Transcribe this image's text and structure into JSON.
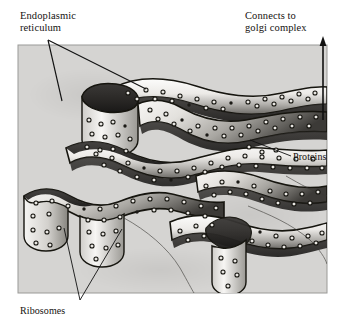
{
  "figure": {
    "kind": "biology-diagram",
    "subject": "endoplasmic reticulum",
    "panel": {
      "background_color": "#d5d4d2",
      "border_color": "#8d8d8b",
      "x": 18,
      "y": 45,
      "width": 309,
      "height": 248
    },
    "palette": {
      "page_background": "#ffffff",
      "panel_fill": "#d5d4d2",
      "membrane_light": "#fbfbfa",
      "membrane_mid": "#b9b8b5",
      "membrane_shadow": "#4a4845",
      "membrane_dark": "#201f1d",
      "outline": "#16150f",
      "ribosome_ring": "#15140f",
      "leader_line": "#111111",
      "text": "#15120f"
    }
  },
  "labels": {
    "endoplasmic_reticulum": "Endoplasmic\nreticulum",
    "connects_to_golgi": "Connects to\ngolgi complex",
    "proteins": "Proteins",
    "ribosomes": "Ribosomes"
  },
  "annotations": {
    "leaders": [
      {
        "name": "er-leader-left",
        "from": [
          48,
          40
        ],
        "to": [
          62,
          101
        ]
      },
      {
        "name": "er-leader-right",
        "from": [
          48,
          40
        ],
        "to": [
          146,
          89
        ]
      },
      {
        "name": "proteins-leader",
        "from": [
          291,
          156
        ],
        "to": [
          250,
          140
        ]
      },
      {
        "name": "ribosome-leader-left",
        "from": [
          80,
          300
        ],
        "to": [
          64,
          228
        ]
      },
      {
        "name": "ribosome-leader-right",
        "from": [
          80,
          300
        ],
        "to": [
          122,
          229
        ]
      }
    ],
    "arrows": [
      {
        "name": "golgi-arrow",
        "from": [
          323,
          120
        ],
        "to": [
          323,
          38
        ],
        "direction": "up"
      }
    ]
  },
  "structure": {
    "element": "rough endoplasmic reticulum cisternae",
    "cisterna_count": 7,
    "surface_features": "ribosomes as small rings on membrane faces",
    "ribosome_count": 180
  }
}
